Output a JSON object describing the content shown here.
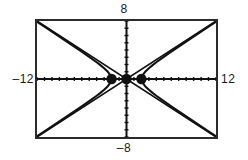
{
  "screen": {
    "kind": "graphing-calculator-screen",
    "background_color": "#ffffff",
    "frame_color": "#2b2b2b",
    "curve_color": "#111111"
  },
  "window_labels": {
    "ymax": "8",
    "ymin": "–8",
    "xmin": "–12",
    "xmax": "12"
  },
  "chart_data": {
    "type": "line",
    "title": "",
    "xlabel": "",
    "ylabel": "",
    "xlim": [
      -12,
      12
    ],
    "ylim": [
      -8,
      8
    ],
    "xtick_step": 1,
    "ytick_step": 1,
    "grid": false,
    "legend": false,
    "axes": {
      "x_axis_y": 0,
      "y_axis_x": 0,
      "tick_length_px": 4,
      "axis_on": true
    },
    "series": [
      {
        "name": "hyperbola-right-branch",
        "style": "solid",
        "x": [
          2,
          2.2,
          2.5,
          3,
          3.5,
          4,
          5,
          6,
          7,
          8,
          9,
          10,
          11,
          12
        ],
        "y": [
          0,
          0.5783,
          0.9979,
          1.4907,
          1.9123,
          2.3094,
          3.0551,
          3.7712,
          4.4721,
          5.164,
          5.85,
          6.532,
          7.2111,
          7.8881
        ]
      },
      {
        "name": "hyperbola-right-branch-lower",
        "style": "solid",
        "x": [
          2,
          2.2,
          2.5,
          3,
          3.5,
          4,
          5,
          6,
          7,
          8,
          9,
          10,
          11,
          12
        ],
        "y": [
          0,
          -0.5783,
          -0.9979,
          -1.4907,
          -1.9123,
          -2.3094,
          -3.0551,
          -3.7712,
          -4.4721,
          -5.164,
          -5.85,
          -6.532,
          -7.2111,
          -7.8881
        ]
      },
      {
        "name": "hyperbola-left-branch-upper",
        "style": "solid",
        "x": [
          -2,
          -2.2,
          -2.5,
          -3,
          -3.5,
          -4,
          -5,
          -6,
          -7,
          -8,
          -9,
          -10,
          -11,
          -12
        ],
        "y": [
          0,
          0.5783,
          0.9979,
          1.4907,
          1.9123,
          2.3094,
          3.0551,
          3.7712,
          4.4721,
          5.164,
          5.85,
          6.532,
          7.2111,
          7.8881
        ]
      },
      {
        "name": "hyperbola-left-branch-lower",
        "style": "solid",
        "x": [
          -2,
          -2.2,
          -2.5,
          -3,
          -3.5,
          -4,
          -5,
          -6,
          -7,
          -8,
          -9,
          -10,
          -11,
          -12
        ],
        "y": [
          0,
          -0.5783,
          -0.9979,
          -1.4907,
          -1.9123,
          -2.3094,
          -3.0551,
          -3.7712,
          -4.4721,
          -5.164,
          -5.85,
          -6.532,
          -7.2111,
          -7.8881
        ]
      },
      {
        "name": "asymptote-positive-slope",
        "style": "solid",
        "slope": 0.6667,
        "x": [
          -12,
          12
        ],
        "y": [
          -8,
          8
        ]
      },
      {
        "name": "asymptote-negative-slope",
        "style": "solid",
        "slope": -0.6667,
        "x": [
          -12,
          12
        ],
        "y": [
          8,
          -8
        ]
      }
    ],
    "points": [
      {
        "name": "vertex-left",
        "x": -2,
        "y": 0,
        "marker": "filled-circle"
      },
      {
        "name": "center-origin",
        "x": 0,
        "y": 0,
        "marker": "filled-circle"
      },
      {
        "name": "vertex-right",
        "x": 2,
        "y": 0,
        "marker": "filled-circle"
      }
    ],
    "annotations": []
  }
}
